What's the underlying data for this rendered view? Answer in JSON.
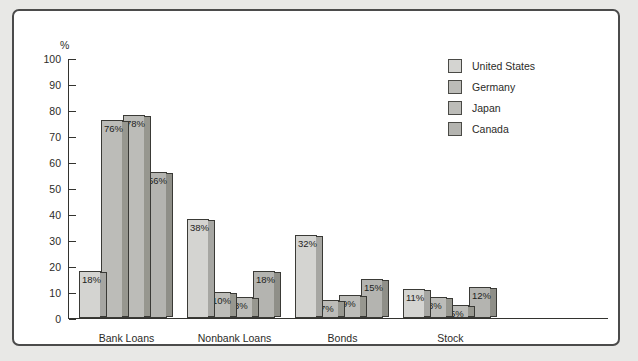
{
  "figure": {
    "percent_axis_label": "%",
    "frame_border_color": "#4b4b4b",
    "page_background": "#e8e8e6",
    "plot_background": "#ffffff"
  },
  "chart_data": {
    "type": "bar",
    "title": "",
    "subtitle": "",
    "xlabel": "",
    "ylabel": "%",
    "ylim": [
      0,
      100
    ],
    "ytick_step": 10,
    "yticks": [
      100,
      90,
      80,
      70,
      60,
      50,
      40,
      30,
      20,
      10,
      0
    ],
    "ytick_labels": [
      "100",
      "90",
      "80",
      "70",
      "60",
      "50",
      "40",
      "30",
      "20",
      "10",
      "0"
    ],
    "grid": false,
    "legend_position": "top-right",
    "value_label_suffix": "%",
    "categories": [
      "Bank Loans",
      "Nonbank Loans",
      "Bonds",
      "Stock"
    ],
    "series": [
      {
        "name": "United States",
        "color": "#d4d4d1",
        "shade_color": "#a6a6a2",
        "values": [
          18,
          38,
          32,
          11
        ],
        "labels": [
          "18%",
          "38%",
          "32%",
          "11%"
        ]
      },
      {
        "name": "Germany",
        "color": "#bcbcb8",
        "shade_color": "#97978f",
        "values": [
          76,
          10,
          7,
          8
        ],
        "labels": [
          "76%",
          "10%",
          "7%",
          "8%"
        ]
      },
      {
        "name": "Japan",
        "color": "#bcbcb8",
        "shade_color": "#97978f",
        "values": [
          78,
          8,
          9,
          5
        ],
        "labels": [
          "78%",
          "8%",
          "9%",
          "5%"
        ]
      },
      {
        "name": "Canada",
        "color": "#b4b4b0",
        "shade_color": "#8f8f88",
        "values": [
          56,
          18,
          15,
          12
        ],
        "labels": [
          "56%",
          "18%",
          "15%",
          "12%"
        ]
      }
    ]
  },
  "legend": {
    "items": [
      {
        "label": "United States"
      },
      {
        "label": "Germany"
      },
      {
        "label": "Japan"
      },
      {
        "label": "Canada"
      }
    ]
  }
}
